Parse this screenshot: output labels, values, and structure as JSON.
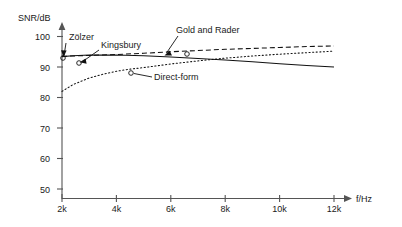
{
  "chart_data": {
    "type": "line",
    "title": "",
    "xlabel": "f/Hz",
    "ylabel": "SNR/dB",
    "xlim": [
      2000,
      12000
    ],
    "ylim": [
      50,
      100
    ],
    "grid": false,
    "legend_position": "inline-annotations",
    "x_tick_labels": [
      "2k",
      "4k",
      "6k",
      "8k",
      "10k",
      "12k"
    ],
    "x_tick_values": [
      2000,
      4000,
      6000,
      8000,
      10000,
      12000
    ],
    "y_tick_labels": [
      "50",
      "60",
      "70",
      "80",
      "90",
      "100"
    ],
    "y_tick_values": [
      50,
      60,
      70,
      80,
      90,
      100
    ],
    "series": [
      {
        "name": "Gold and Rader",
        "style": "dashed",
        "x": [
          2000,
          2400,
          3000,
          4000,
          5000,
          6000,
          7000,
          8000,
          9000,
          10000,
          11000,
          12000
        ],
        "values": [
          93.5,
          93.6,
          93.8,
          94.1,
          94.5,
          95.0,
          95.4,
          95.8,
          96.1,
          96.4,
          96.7,
          96.9
        ]
      },
      {
        "name": "Zölzer",
        "style": "solid",
        "x": [
          2000,
          2400,
          3000,
          4000,
          5000,
          6000,
          7000,
          8000,
          9000,
          10000,
          11000,
          12000
        ],
        "values": [
          93.4,
          93.7,
          93.9,
          93.9,
          93.7,
          93.3,
          92.8,
          92.3,
          91.7,
          91.1,
          90.5,
          90.0
        ]
      },
      {
        "name": "Kingsbury",
        "style": "solid",
        "x": [
          2000,
          2400,
          3000,
          4000,
          5000,
          6000,
          7000,
          8000,
          9000,
          10000,
          11000,
          12000
        ],
        "values": [
          93.4,
          93.7,
          93.9,
          93.9,
          93.7,
          93.3,
          92.8,
          92.3,
          91.7,
          91.1,
          90.5,
          90.0
        ]
      },
      {
        "name": "Direct-form",
        "style": "dotted",
        "x": [
          2000,
          2400,
          3000,
          3500,
          4000,
          4500,
          5000,
          5500,
          6000,
          7000,
          8000,
          9000,
          10000,
          11000,
          12000
        ],
        "values": [
          82.0,
          84.2,
          86.4,
          87.6,
          88.6,
          89.3,
          89.8,
          90.4,
          91.0,
          92.0,
          92.9,
          93.6,
          94.2,
          94.7,
          95.2
        ]
      }
    ],
    "annotations": [
      {
        "label": "Zölzer",
        "text_x": 75,
        "text_y": 40,
        "point_x": 64,
        "point_y": 58
      },
      {
        "label": "Kingsbury",
        "text_x": 100,
        "text_y": 48,
        "point_x": 78,
        "point_y": 62
      },
      {
        "label": "Gold and Rader",
        "text_x": 175,
        "text_y": 33,
        "point_x": 165,
        "point_y": 55
      },
      {
        "label": "Direct-form",
        "text_x": 155,
        "text_y": 79,
        "point_x": 131,
        "point_y": 73
      }
    ],
    "markers": [
      {
        "cx": 63,
        "cy": 58,
        "series": "Zölzer"
      },
      {
        "cx": 79,
        "cy": 63,
        "series": "Kingsbury"
      },
      {
        "cx": 131,
        "cy": 73,
        "series": "Direct-form"
      },
      {
        "cx": 187,
        "cy": 54,
        "series": "Gold and Rader"
      }
    ]
  },
  "axes": {
    "y_axis_title": "SNR/dB",
    "x_axis_title": "f/Hz"
  }
}
